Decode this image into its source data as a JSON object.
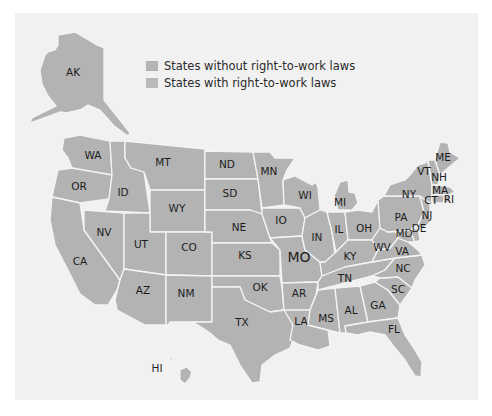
{
  "legend": {
    "items": [
      {
        "label": "States without right-to-work laws",
        "color": "#b4b4b4"
      },
      {
        "label": "States with right-to-work laws",
        "color": "#b9b9b9"
      }
    ]
  },
  "colors": {
    "panel_background": "#f1f1f1",
    "state_fill": "#b3b3b3",
    "state_border": "#f4f4f4",
    "label_text": "#1c1c1c"
  },
  "states": {
    "AK": "AK",
    "HI": "HI",
    "WA": "WA",
    "OR": "OR",
    "CA": "CA",
    "ID": "ID",
    "NV": "NV",
    "MT": "MT",
    "WY": "WY",
    "UT": "UT",
    "CO": "CO",
    "AZ": "AZ",
    "NM": "NM",
    "ND": "ND",
    "SD": "SD",
    "NE": "NE",
    "KS": "KS",
    "OK": "OK",
    "TX": "TX",
    "MN": "MN",
    "IO": "IO",
    "MO": "MO",
    "AR": "AR",
    "LA": "LA",
    "WI": "WI",
    "MI": "MI",
    "IL": "IL",
    "IN": "IN",
    "OH": "OH",
    "KY": "KY",
    "TN": "TN",
    "MS": "MS",
    "AL": "AL",
    "GA": "GA",
    "FL": "FL",
    "SC": "SC",
    "NC": "NC",
    "VA": "VA",
    "WV": "WV",
    "MD": "MD",
    "DE": "DE",
    "PA": "PA",
    "NJ": "NJ",
    "NY": "NY",
    "CT": "CT",
    "RI": "RI",
    "MA": "MA",
    "VT": "VT",
    "NH": "NH",
    "ME": "ME"
  }
}
